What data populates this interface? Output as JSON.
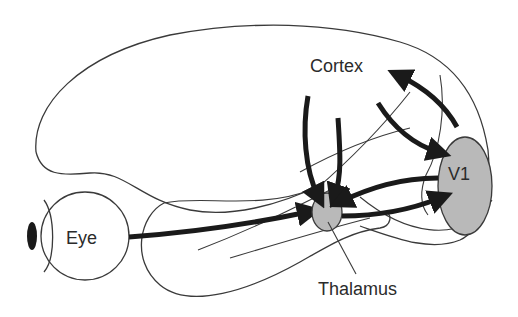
{
  "diagram": {
    "type": "visual-pathway",
    "labels": {
      "cortex": "Cortex",
      "v1": "V1",
      "eye": "Eye",
      "thalamus": "Thalamus"
    },
    "colors": {
      "nucleus_fill": "#b9b9b9",
      "arrow": "#1a1a1a",
      "outline": "#3a3a3a",
      "pupil": "#1a1a1a"
    },
    "connections": [
      {
        "from": "Eye",
        "to": "Thalamus"
      },
      {
        "from": "Thalamus",
        "to": "V1"
      },
      {
        "from": "V1",
        "to": "Thalamus"
      },
      {
        "from": "Cortex",
        "to": "Thalamus"
      },
      {
        "from": "Cortex",
        "to": "Thalamus"
      },
      {
        "from": "Cortex",
        "to": "V1"
      },
      {
        "from": "V1",
        "to": "Cortex"
      }
    ]
  }
}
